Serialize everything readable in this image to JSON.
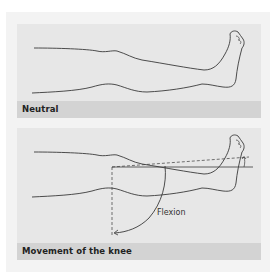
{
  "panels": [
    {
      "id": "neutral",
      "caption": "Neutral",
      "illustration": "leg-extended-line-drawing"
    },
    {
      "id": "movement",
      "caption": "Movement of the knee",
      "illustration": "leg-with-knee-flexion-arc",
      "annotation": "Flexion"
    }
  ],
  "colors": {
    "card_bg": "#f3f3f3",
    "panel_bg": "#e7e7e7",
    "caption_bg": "#d3d3d3",
    "line": "#3a3a3a"
  }
}
